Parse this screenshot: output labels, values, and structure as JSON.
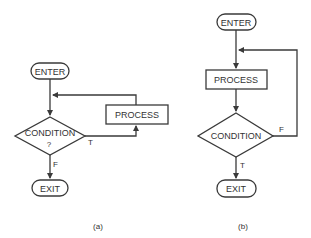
{
  "diagram_a": {
    "enter": "ENTER",
    "condition": "CONDITION",
    "condition_q": "?",
    "process": "PROCESS",
    "true_label": "T",
    "false_label": "F",
    "exit": "EXIT",
    "caption": "(a)"
  },
  "diagram_b": {
    "enter": "ENTER",
    "process": "PROCESS",
    "condition": "CONDITION",
    "false_label": "F",
    "true_label": "T",
    "exit": "EXIT",
    "caption": "(b)"
  },
  "colors": {
    "stroke": "#3a3a3a",
    "text": "#333333",
    "background": "#ffffff"
  }
}
